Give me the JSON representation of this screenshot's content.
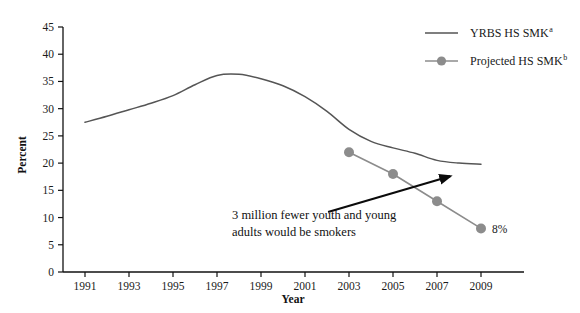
{
  "chart_data": {
    "type": "line",
    "title": "",
    "xlabel": "Year",
    "ylabel": "Percent",
    "xlim": [
      1990,
      2009.6
    ],
    "ylim": [
      0,
      45
    ],
    "ytick_step": 5,
    "grid": false,
    "legend_position": "top-right",
    "x_ticks": [
      "1991",
      "1993",
      "1995",
      "1997",
      "1999",
      "2001",
      "2003",
      "2005",
      "2007",
      "2009"
    ],
    "y_ticks": [
      "0",
      "5",
      "10",
      "15",
      "20",
      "25",
      "30",
      "35",
      "40",
      "45"
    ],
    "series": [
      {
        "name": "YRBS HS SMK",
        "name_superscript": "a",
        "style": "line",
        "color": "#555555",
        "markers": false,
        "x": [
          1991,
          1992,
          1993,
          1994,
          1995,
          1996,
          1997,
          1998,
          1999,
          2000,
          2001,
          2002,
          2003,
          2004,
          2005,
          2006,
          2007,
          2008,
          2009
        ],
        "values": [
          27.5,
          28.6,
          29.8,
          31.0,
          32.4,
          34.4,
          36.1,
          36.3,
          35.5,
          34.2,
          32.2,
          29.5,
          26.2,
          24.0,
          22.8,
          21.8,
          20.5,
          20.0,
          19.8
        ]
      },
      {
        "name": "Projected HS SMK",
        "name_superscript": "b",
        "style": "line-marker",
        "color": "#8c8c8c",
        "markers": true,
        "x": [
          2003,
          2005,
          2007,
          2009
        ],
        "values": [
          22,
          18,
          13,
          8
        ]
      }
    ],
    "annotations": [
      {
        "name": "callout-text",
        "text_lines": [
          "3 million fewer youth and young",
          "adults would be smokers"
        ],
        "arrow_from": [
          2002.05,
          11.0
        ],
        "arrow_to": [
          2007.6,
          17.6
        ]
      },
      {
        "name": "endpoint-value",
        "text": "8%",
        "at": [
          2009,
          8
        ]
      }
    ]
  },
  "legend": {
    "items": [
      {
        "label": "YRBS HS SMK",
        "sup": "a",
        "color": "#555555",
        "marker": false
      },
      {
        "label": "Projected HS SMK",
        "sup": "b",
        "color": "#8c8c8c",
        "marker": true
      }
    ]
  },
  "axes": {
    "x_title": "Year",
    "y_title": "Percent"
  }
}
